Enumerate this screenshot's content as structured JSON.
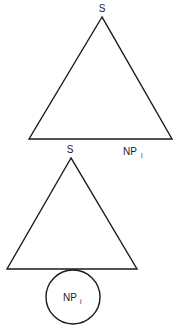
{
  "diagram": {
    "top_tree": {
      "root_label": "S",
      "yield_labels": [
        {
          "main": "S",
          "sub": ""
        },
        {
          "main": "NP",
          "sub": "i"
        }
      ]
    },
    "bottom_tree": {
      "root_label": "S",
      "attached_node": {
        "main": "NP",
        "sub": "i"
      }
    },
    "colors": {
      "stroke": "#1a1a1a",
      "text": "#222222",
      "background": "#ffffff"
    }
  }
}
